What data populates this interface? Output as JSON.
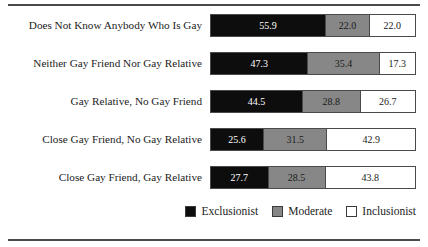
{
  "chart_data": {
    "type": "bar",
    "orientation": "horizontal",
    "stacked": true,
    "stack_total": 100,
    "title": "",
    "subtitle": "",
    "xlabel": "",
    "ylabel": "",
    "xlim": [
      0,
      100
    ],
    "grid": false,
    "legend_position": "bottom-right",
    "categories": [
      "Does Not Know Anybody Who Is Gay",
      "Neither Gay Friend Nor Gay Relative",
      "Gay Relative, No Gay Friend",
      "Close Gay Friend, No Gay Relative",
      "Close Gay Friend, Gay Relative"
    ],
    "series": [
      {
        "name": "Exclusionist",
        "color": "#0d0d0d",
        "values": [
          55.9,
          47.3,
          44.5,
          25.6,
          27.7
        ],
        "labels": [
          "55.9",
          "47.3",
          "44.5",
          "25.6",
          "27.7"
        ]
      },
      {
        "name": "Moderate",
        "color": "#878787",
        "values": [
          22.0,
          35.4,
          28.8,
          31.5,
          28.5
        ],
        "labels": [
          "22.0",
          "35.4",
          "28.8",
          "31.5",
          "28.5"
        ]
      },
      {
        "name": "Inclusionist",
        "color": "#ffffff",
        "values": [
          22.0,
          17.3,
          26.7,
          42.9,
          43.8
        ],
        "labels": [
          "22.0",
          "17.3",
          "26.7",
          "42.9",
          "43.8"
        ]
      }
    ]
  },
  "rows": [
    {
      "label": "Does Not Know Anybody Who Is Gay",
      "exclusionist": "55.9",
      "moderate": "22.0",
      "inclusionist": "22.0"
    },
    {
      "label": "Neither Gay Friend Nor Gay Relative",
      "exclusionist": "47.3",
      "moderate": "35.4",
      "inclusionist": "17.3"
    },
    {
      "label": "Gay Relative, No Gay Friend",
      "exclusionist": "44.5",
      "moderate": "28.8",
      "inclusionist": "26.7"
    },
    {
      "label": "Close Gay Friend, No Gay Relative",
      "exclusionist": "25.6",
      "moderate": "31.5",
      "inclusionist": "42.9"
    },
    {
      "label": "Close Gay Friend, Gay Relative",
      "exclusionist": "27.7",
      "moderate": "28.5",
      "inclusionist": "43.8"
    }
  ],
  "legend": {
    "items": [
      {
        "label": "Exclusionist",
        "color": "#0d0d0d"
      },
      {
        "label": "Moderate",
        "color": "#878787"
      },
      {
        "label": "Inclusionist",
        "color": "#ffffff"
      }
    ]
  }
}
